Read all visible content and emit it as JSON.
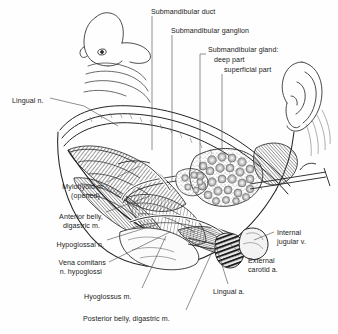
{
  "figure": {
    "background_color": "#fefefe",
    "ink_color": "#1b1b1b",
    "leader_color": "#4a4a4a"
  },
  "labels": [
    {
      "id": "submandibular-duct",
      "text": "Submandibular duct",
      "x": 151,
      "y": 8,
      "align": "left"
    },
    {
      "id": "submandibular-ganglion",
      "text": "Submandibular ganglion",
      "x": 171,
      "y": 27,
      "align": "left"
    },
    {
      "id": "submandibular-gland",
      "text": "Submandibular gland:",
      "x": 208,
      "y": 46,
      "align": "left"
    },
    {
      "id": "deep-part",
      "text": "deep part",
      "x": 214,
      "y": 56,
      "align": "left"
    },
    {
      "id": "superficial-part",
      "text": "superficial part",
      "x": 224,
      "y": 66,
      "align": "left"
    },
    {
      "id": "lingual-n",
      "text": "Lingual n.",
      "x": 12,
      "y": 97,
      "align": "left"
    },
    {
      "id": "mylohyoid-m",
      "text": "Mylohyoid m.",
      "x": 105,
      "y": 183,
      "align": "right"
    },
    {
      "id": "mylohyoid-opened",
      "text": "(opened)",
      "x": 100,
      "y": 192,
      "align": "right"
    },
    {
      "id": "anterior-belly-digastric",
      "text": "Anterior belly,",
      "x": 103,
      "y": 213,
      "align": "right"
    },
    {
      "id": "digastric-m",
      "text": "digastric m.",
      "x": 100,
      "y": 222,
      "align": "right"
    },
    {
      "id": "hypoglossal-n",
      "text": "Hypoglossal n.",
      "x": 104,
      "y": 241,
      "align": "right"
    },
    {
      "id": "vena-comitans",
      "text": "Vena comitans",
      "x": 106,
      "y": 259,
      "align": "right"
    },
    {
      "id": "n-hypoglossi",
      "text": "n. hypoglossi",
      "x": 102,
      "y": 268,
      "align": "right"
    },
    {
      "id": "hyoglossus-m",
      "text": "Hyoglossus m.",
      "x": 84,
      "y": 293,
      "align": "left"
    },
    {
      "id": "posterior-belly-digastric",
      "text": "Posterior belly, digastric m.",
      "x": 83,
      "y": 315,
      "align": "left"
    },
    {
      "id": "lingual-a",
      "text": "Lingual a.",
      "x": 213,
      "y": 288,
      "align": "left"
    },
    {
      "id": "internal-jugular-v",
      "text": "Internal",
      "x": 277,
      "y": 229,
      "align": "left"
    },
    {
      "id": "jugular-v-line2",
      "text": "jugular v.",
      "x": 277,
      "y": 238,
      "align": "left"
    },
    {
      "id": "external-carotid-a",
      "text": "External",
      "x": 248,
      "y": 257,
      "align": "left"
    },
    {
      "id": "carotid-a-line2",
      "text": "carotid a.",
      "x": 248,
      "y": 266,
      "align": "left"
    }
  ],
  "structures": [
    {
      "id": "head-profile",
      "name": "head-profile-outline"
    },
    {
      "id": "ear",
      "name": "auricle"
    },
    {
      "id": "eye",
      "name": "eye"
    },
    {
      "id": "nose",
      "name": "nose"
    },
    {
      "id": "mandible",
      "name": "mandible-outline"
    },
    {
      "id": "mylohyoid",
      "name": "mylohyoid-muscle"
    },
    {
      "id": "digastric-anterior",
      "name": "anterior-belly-digastric"
    },
    {
      "id": "digastric-posterior",
      "name": "posterior-belly-digastric"
    },
    {
      "id": "hyoglossus",
      "name": "hyoglossus-muscle"
    },
    {
      "id": "gland-superficial",
      "name": "submandibular-gland-superficial"
    },
    {
      "id": "gland-deep",
      "name": "submandibular-gland-deep"
    },
    {
      "id": "duct",
      "name": "submandibular-duct"
    },
    {
      "id": "lingual-nerve",
      "name": "lingual-nerve"
    },
    {
      "id": "hypoglossal-nerve",
      "name": "hypoglossal-nerve"
    },
    {
      "id": "external-carotid",
      "name": "external-carotid-artery"
    },
    {
      "id": "internal-jugular",
      "name": "internal-jugular-vein"
    },
    {
      "id": "lingual-artery",
      "name": "lingual-artery"
    },
    {
      "id": "tongue",
      "name": "tongue"
    }
  ]
}
